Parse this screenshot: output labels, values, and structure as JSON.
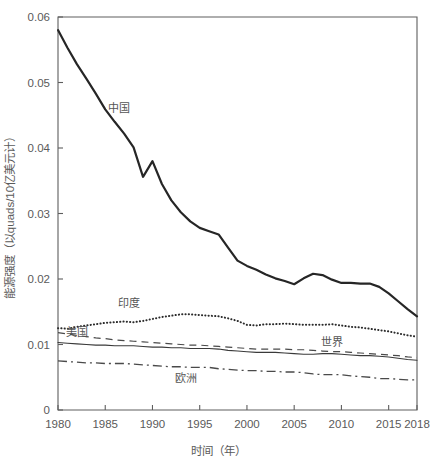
{
  "figure": {
    "background_color": "#ffffff",
    "axis_color": "#5e5e5e",
    "text_color": "#5a5a5a"
  },
  "axes": {
    "x_title": "时间（年）",
    "y_title": "能源强度（以quads/10亿美元计）",
    "x_ticks": [
      "1980",
      "1985",
      "1990",
      "1995",
      "2000",
      "2005",
      "2010",
      "2015",
      "2018"
    ],
    "y_ticks": [
      "0",
      "0.01",
      "0.02",
      "0.03",
      "0.04",
      "0.05",
      "0.06"
    ]
  },
  "series_labels": {
    "china": "中国",
    "india": "印度",
    "usa": "美国",
    "world": "世界",
    "europe": "欧洲"
  },
  "chart_data": {
    "type": "line",
    "title": "",
    "xlabel": "时间（年）",
    "ylabel": "能源强度（以quads/10亿美元计）",
    "xlim": [
      1980,
      2018
    ],
    "ylim": [
      0,
      0.06
    ],
    "grid": false,
    "legend_position": "inline-annotations",
    "x": [
      1980,
      1981,
      1982,
      1983,
      1984,
      1985,
      1986,
      1987,
      1988,
      1989,
      1990,
      1991,
      1992,
      1993,
      1994,
      1995,
      1996,
      1997,
      1998,
      1999,
      2000,
      2001,
      2002,
      2003,
      2004,
      2005,
      2006,
      2007,
      2008,
      2009,
      2010,
      2011,
      2012,
      2013,
      2014,
      2015,
      2016,
      2017,
      2018
    ],
    "series": [
      {
        "name": "中国",
        "style": "solid-thick",
        "color": "#262626",
        "values": [
          0.058,
          0.0553,
          0.0528,
          0.0506,
          0.0483,
          0.0459,
          0.044,
          0.0422,
          0.0401,
          0.0356,
          0.038,
          0.0345,
          0.032,
          0.0302,
          0.0288,
          0.0278,
          0.0273,
          0.0268,
          0.0248,
          0.0228,
          0.022,
          0.0214,
          0.0207,
          0.0201,
          0.0197,
          0.0192,
          0.0201,
          0.0208,
          0.0206,
          0.0199,
          0.0194,
          0.0194,
          0.0193,
          0.0193,
          0.0188,
          0.0178,
          0.0166,
          0.0154,
          0.0143
        ]
      },
      {
        "name": "印度",
        "style": "dotted",
        "color": "#2b2b2b",
        "values": [
          0.0125,
          0.0124,
          0.0127,
          0.0129,
          0.0131,
          0.0133,
          0.0134,
          0.0135,
          0.0134,
          0.0136,
          0.0139,
          0.0142,
          0.0144,
          0.0146,
          0.0146,
          0.0145,
          0.0144,
          0.0143,
          0.014,
          0.0136,
          0.013,
          0.0129,
          0.0131,
          0.0131,
          0.0132,
          0.0131,
          0.013,
          0.013,
          0.013,
          0.0131,
          0.0129,
          0.0127,
          0.0126,
          0.0124,
          0.0122,
          0.012,
          0.0117,
          0.0114,
          0.0112
        ]
      },
      {
        "name": "美国",
        "style": "solid-thin",
        "color": "#3a3a3a",
        "values": [
          0.0103,
          0.0102,
          0.0101,
          0.01,
          0.0099,
          0.0099,
          0.0098,
          0.0098,
          0.0098,
          0.0097,
          0.0096,
          0.0096,
          0.0095,
          0.0095,
          0.0094,
          0.0094,
          0.0094,
          0.0093,
          0.0091,
          0.009,
          0.0089,
          0.0088,
          0.0088,
          0.0088,
          0.0087,
          0.0086,
          0.0085,
          0.0085,
          0.0086,
          0.0086,
          0.0085,
          0.0084,
          0.0083,
          0.0083,
          0.0082,
          0.0081,
          0.0079,
          0.0077,
          0.0076
        ]
      },
      {
        "name": "世界",
        "style": "dashed",
        "color": "#4a4a4a",
        "values": [
          0.0118,
          0.0116,
          0.0114,
          0.0112,
          0.011,
          0.0109,
          0.0107,
          0.0106,
          0.0105,
          0.0104,
          0.0103,
          0.0102,
          0.0101,
          0.01,
          0.0099,
          0.0099,
          0.0098,
          0.0097,
          0.0096,
          0.0095,
          0.0094,
          0.0093,
          0.0093,
          0.0093,
          0.0093,
          0.0092,
          0.0092,
          0.0091,
          0.009,
          0.0089,
          0.0089,
          0.0088,
          0.0087,
          0.0086,
          0.0085,
          0.0084,
          0.0083,
          0.0081,
          0.008
        ]
      },
      {
        "name": "欧洲",
        "style": "dash-dot",
        "color": "#4a4a4a",
        "values": [
          0.0075,
          0.0074,
          0.0073,
          0.0072,
          0.0072,
          0.0071,
          0.0071,
          0.0071,
          0.007,
          0.0069,
          0.0068,
          0.0067,
          0.0066,
          0.0066,
          0.0065,
          0.0065,
          0.0065,
          0.0063,
          0.0062,
          0.0061,
          0.006,
          0.006,
          0.0059,
          0.0059,
          0.0058,
          0.0058,
          0.0057,
          0.0055,
          0.0054,
          0.0054,
          0.0054,
          0.0052,
          0.0051,
          0.005,
          0.0048,
          0.0048,
          0.0047,
          0.0046,
          0.0046
        ]
      }
    ],
    "annotations": [
      {
        "text": "中国",
        "x": 1986.5,
        "y": 0.0455
      },
      {
        "text": "印度",
        "x": 1987.5,
        "y": 0.0158
      },
      {
        "text": "美国",
        "x": 1982.0,
        "y": 0.0113
      },
      {
        "text": "世界",
        "x": 2009.0,
        "y": 0.0098
      },
      {
        "text": "欧洲",
        "x": 1993.5,
        "y": 0.0043
      }
    ]
  }
}
